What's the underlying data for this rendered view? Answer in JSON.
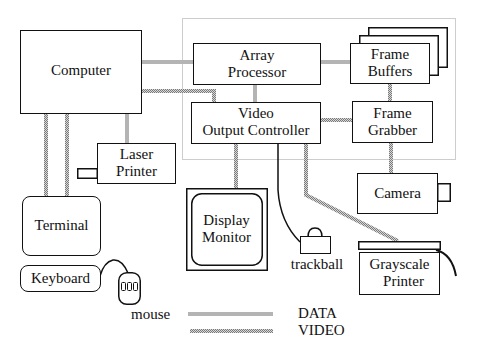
{
  "diagram": {
    "components": {
      "computer": {
        "label": "Computer"
      },
      "array_processor": {
        "line1": "Array",
        "line2": "Processor"
      },
      "frame_buffers": {
        "line1": "Frame",
        "line2": "Buffers"
      },
      "video_output_controller": {
        "line1": "Video",
        "line2": "Output Controller"
      },
      "frame_grabber": {
        "line1": "Frame",
        "line2": "Grabber"
      },
      "laser_printer": {
        "line1": "Laser",
        "line2": "Printer"
      },
      "terminal": {
        "label": "Terminal"
      },
      "keyboard": {
        "label": "Keyboard"
      },
      "mouse": {
        "label": "mouse"
      },
      "display_monitor": {
        "line1": "Display",
        "line2": "Monitor"
      },
      "trackball": {
        "label": "trackball"
      },
      "camera": {
        "label": "Camera"
      },
      "grayscale_printer": {
        "line1": "Grayscale",
        "line2": "Printer"
      }
    },
    "legend": {
      "data_label": "DATA",
      "video_label": "VIDEO"
    },
    "colors": {
      "data_line": "#b4b4b4",
      "video_line": "#8a8a8a",
      "outline": "#111111",
      "boundary": "#9a9a9a"
    }
  }
}
